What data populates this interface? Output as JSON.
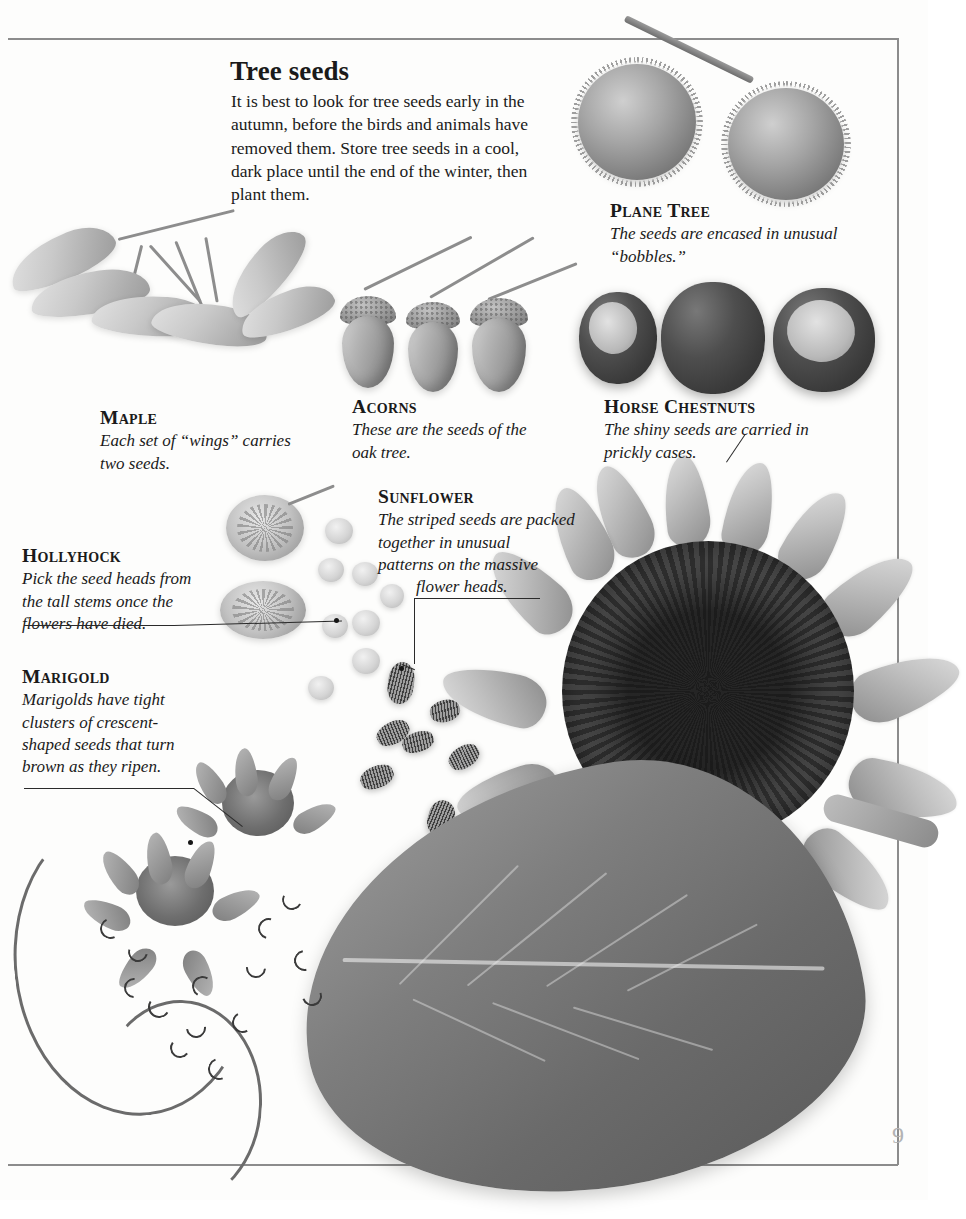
{
  "page": {
    "number": "9",
    "heading": "Tree seeds",
    "intro": "It is best to look for tree seeds early in the autumn, before the birds and animals have removed them. Store tree seeds in a cool, dark place until the end of the winter, then plant them."
  },
  "captions": {
    "plane_tree": {
      "name": "Plane Tree",
      "text": "The seeds are encased in unusual “bobbles.”"
    },
    "maple": {
      "name": "Maple",
      "text": "Each set of “wings” carries two seeds."
    },
    "acorns": {
      "name": "Acorns",
      "text": "These are the seeds of the oak tree."
    },
    "horse_chestnuts": {
      "name": "Horse Chestnuts",
      "text": "The shiny seeds are carried in prickly cases."
    },
    "sunflower": {
      "name": "Sunflower",
      "line1": "The striped seeds are packed",
      "line2": "together in unusual",
      "line3": "patterns on the massive",
      "line4": "flower heads."
    },
    "hollyhock": {
      "name": "Hollyhock",
      "text": "Pick the seed heads from the tall stems once the flowers have died."
    },
    "marigold": {
      "name": "Marigold",
      "text": "Marigolds have tight clusters of crescent-shaped seeds that turn brown as they ripen."
    }
  },
  "colors": {
    "ink": "#1a1a1a",
    "rule": "#8c8c8c",
    "page_number": "#b3b3b3",
    "paper": "#fdfdfc"
  }
}
